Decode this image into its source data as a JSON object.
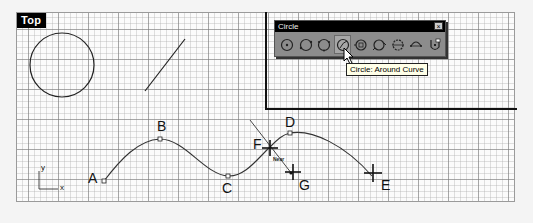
{
  "viewport": {
    "name": "Top",
    "grid": {
      "major_spacing_px": 30,
      "minor_spacing_px": 6
    }
  },
  "toolbar": {
    "title": "Circle",
    "close_glyph": "×",
    "buttons": [
      {
        "name": "circle-center-radius",
        "icon": "circle-center-icon",
        "active": false
      },
      {
        "name": "circle-diameter",
        "icon": "circle-diameter-icon",
        "active": false
      },
      {
        "name": "circle-3point",
        "icon": "circle-3point-icon",
        "active": false
      },
      {
        "name": "circle-around-curve",
        "icon": "circle-around-curve-icon",
        "active": true
      },
      {
        "name": "circle-tangent-tangent-radius",
        "icon": "circle-ttr-icon",
        "active": false
      },
      {
        "name": "circle-tangent-3",
        "icon": "circle-tangent3-icon",
        "active": false
      },
      {
        "name": "circle-fit-points",
        "icon": "circle-fit-icon",
        "active": false
      },
      {
        "name": "circle-deformable",
        "icon": "circle-deformable-icon",
        "active": false
      },
      {
        "name": "circle-options",
        "icon": "circle-options-icon",
        "active": false
      }
    ]
  },
  "tooltip": {
    "text": "Circle: Around Curve"
  },
  "points": {
    "A": "A",
    "B": "B",
    "C": "C",
    "D": "D",
    "E": "E",
    "F": "F",
    "G": "G"
  },
  "snap_label": "Near",
  "axes": {
    "x": "x",
    "y": "y"
  },
  "colors": {
    "grid_major": "#8a8a8a",
    "grid_minor": "#c8c8c8",
    "curve": "#333333",
    "label_bg": "#000000",
    "toolbar_bg": "#8c8c8c",
    "tooltip_bg": "#ffffe8"
  }
}
